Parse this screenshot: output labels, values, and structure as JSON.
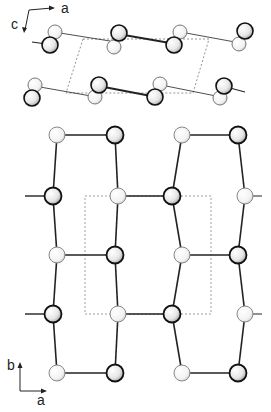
{
  "figure": {
    "top_panel": {
      "projection": "view along b",
      "axes": {
        "horizontal": "a",
        "vertical": "c"
      },
      "unit_cell": "dashed parallelogram",
      "atom_types": [
        "dark",
        "light"
      ]
    },
    "bottom_panel": {
      "projection": "view along c",
      "axes": {
        "horizontal": "a",
        "vertical": "b"
      },
      "unit_cell": "dashed rectangle",
      "rows": [
        [
          "light",
          "dark",
          "light",
          "dark"
        ],
        [
          "dark",
          "light",
          "dark",
          "light"
        ],
        [
          "light",
          "dark",
          "light",
          "dark"
        ],
        [
          "dark",
          "light",
          "dark",
          "light"
        ],
        [
          "light",
          "dark",
          "light",
          "dark"
        ]
      ]
    },
    "caption_fragment": "Figure ... (cropped)"
  },
  "labels": {
    "top_a": "a",
    "top_c": "c",
    "bottom_a": "a",
    "bottom_b": "b"
  },
  "colors": {
    "dark_outline": "#111111",
    "light_outline": "#888888",
    "bond": "#222222",
    "cell": "#777777"
  }
}
